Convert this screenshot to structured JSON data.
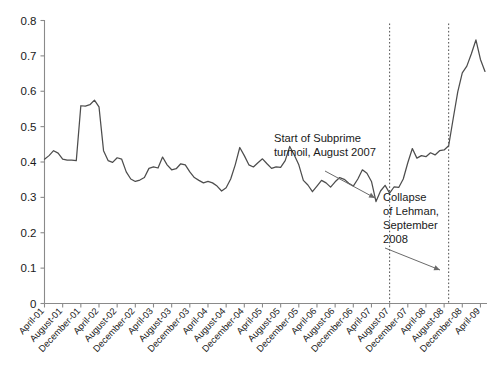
{
  "chart_data": {
    "type": "line",
    "title": "",
    "xlabel": "",
    "ylabel": "",
    "ylim": [
      0,
      0.8
    ],
    "yticks": [
      0,
      0.1,
      0.2,
      0.3,
      0.4,
      0.5,
      0.6,
      0.7,
      0.8
    ],
    "ytick_labels": [
      "0",
      "0.1",
      "0.2",
      "0.3",
      "0.4",
      "0.5",
      "0.6",
      "0.7",
      "0.8"
    ],
    "grid": false,
    "legend": "none",
    "line_color": "#4d4d4d",
    "axis_color": "#8a8a8a",
    "xtick_labels": [
      "April-01",
      "August-01",
      "December-01",
      "April-02",
      "August-02",
      "December-02",
      "April-03",
      "August-03",
      "December-03",
      "April-04",
      "August-04",
      "December-04",
      "April-05",
      "August-05",
      "December-05",
      "April-06",
      "August-06",
      "December-06",
      "April-07",
      "August-07",
      "December-07",
      "April-08",
      "August-08",
      "December-08",
      "April-09"
    ],
    "x_start_label": "April-01",
    "x_end_label": "April-09",
    "x_tick_interval_months": 4,
    "series": [
      {
        "name": "ratio",
        "values": [
          0.408,
          0.418,
          0.432,
          0.425,
          0.408,
          0.405,
          0.405,
          0.404,
          0.559,
          0.558,
          0.562,
          0.575,
          0.556,
          0.432,
          0.404,
          0.399,
          0.412,
          0.408,
          0.372,
          0.352,
          0.345,
          0.349,
          0.356,
          0.382,
          0.386,
          0.383,
          0.414,
          0.392,
          0.378,
          0.381,
          0.395,
          0.392,
          0.372,
          0.356,
          0.348,
          0.341,
          0.345,
          0.341,
          0.332,
          0.318,
          0.327,
          0.352,
          0.392,
          0.441,
          0.418,
          0.392,
          0.386,
          0.398,
          0.409,
          0.395,
          0.382,
          0.386,
          0.385,
          0.404,
          0.444,
          0.42,
          0.392,
          0.348,
          0.335,
          0.316,
          0.332,
          0.348,
          0.341,
          0.329,
          0.344,
          0.356,
          0.351,
          0.34,
          0.332,
          0.352,
          0.378,
          0.368,
          0.345,
          0.288,
          0.318,
          0.334,
          0.312,
          0.33,
          0.328,
          0.352,
          0.398,
          0.438,
          0.411,
          0.418,
          0.415,
          0.426,
          0.42,
          0.432,
          0.434,
          0.446,
          0.523,
          0.598,
          0.652,
          0.671,
          0.706,
          0.745,
          0.69,
          0.656
        ]
      }
    ],
    "events": [
      {
        "id": "subprime",
        "label_lines": [
          "Start of Subprime",
          "turmoil, August 2007"
        ],
        "date_label": "August 2007"
      },
      {
        "id": "lehman",
        "label_lines": [
          "Collapse",
          "of Lehman,",
          "September",
          "2008"
        ],
        "date_label": "September 2008"
      }
    ]
  }
}
